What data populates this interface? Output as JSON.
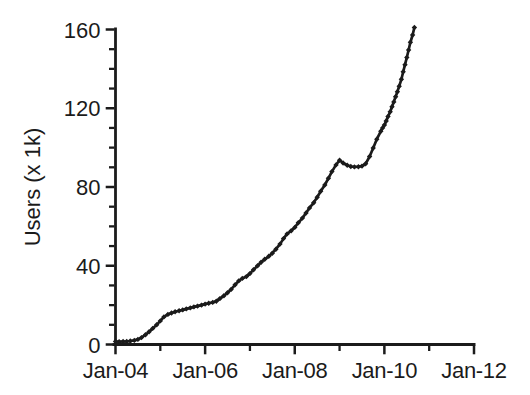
{
  "page": {
    "background": "#ffffff",
    "ink_color": "#1b1b1b"
  },
  "chart_data": {
    "type": "line",
    "title": "",
    "xlabel": "",
    "ylabel": "Users (x 1k)",
    "grid": false,
    "legend": null,
    "x_unit": "years after Jan-2004",
    "xlim": [
      0,
      8
    ],
    "ylim": [
      0,
      160
    ],
    "x_axis": {
      "major_ticks": [
        {
          "pos": 0,
          "label": "Jan-04"
        },
        {
          "pos": 2,
          "label": "Jan-06"
        },
        {
          "pos": 4,
          "label": "Jan-08"
        },
        {
          "pos": 6,
          "label": "Jan-10"
        },
        {
          "pos": 8,
          "label": "Jan-12"
        }
      ],
      "minor_ticks": [
        1,
        3,
        5,
        7
      ]
    },
    "y_axis": {
      "major_ticks": [
        {
          "pos": 0,
          "label": "0"
        },
        {
          "pos": 40,
          "label": "40"
        },
        {
          "pos": 80,
          "label": "80"
        },
        {
          "pos": 120,
          "label": "120"
        },
        {
          "pos": 160,
          "label": "160"
        }
      ],
      "minor_ticks": [
        10,
        20,
        30,
        50,
        60,
        70,
        90,
        100,
        110,
        130,
        140,
        150
      ]
    },
    "series": [
      {
        "name": "Users",
        "color": "#1b1b1b",
        "marker": "diamond",
        "points": [
          [
            0,
            1.5
          ],
          [
            0.08,
            1.4
          ],
          [
            0.17,
            1.5
          ],
          [
            0.25,
            1.6
          ],
          [
            0.33,
            1.8
          ],
          [
            0.42,
            2.1
          ],
          [
            0.5,
            2.6
          ],
          [
            0.58,
            3.5
          ],
          [
            0.67,
            5
          ],
          [
            0.75,
            6.5
          ],
          [
            0.83,
            8.2
          ],
          [
            0.92,
            10
          ],
          [
            1,
            12
          ],
          [
            1.08,
            14
          ],
          [
            1.17,
            15.3
          ],
          [
            1.25,
            16
          ],
          [
            1.33,
            16.6
          ],
          [
            1.42,
            17.1
          ],
          [
            1.5,
            17.6
          ],
          [
            1.58,
            18.1
          ],
          [
            1.67,
            18.6
          ],
          [
            1.75,
            19.1
          ],
          [
            1.83,
            19.5
          ],
          [
            1.92,
            20
          ],
          [
            2,
            20.5
          ],
          [
            2.08,
            21
          ],
          [
            2.17,
            21.4
          ],
          [
            2.25,
            22
          ],
          [
            2.33,
            23.3
          ],
          [
            2.42,
            24.8
          ],
          [
            2.5,
            26.3
          ],
          [
            2.58,
            28
          ],
          [
            2.67,
            30.3
          ],
          [
            2.75,
            32.3
          ],
          [
            2.83,
            33.6
          ],
          [
            2.92,
            34.5
          ],
          [
            3,
            36
          ],
          [
            3.08,
            38
          ],
          [
            3.17,
            40
          ],
          [
            3.25,
            41.8
          ],
          [
            3.33,
            43.3
          ],
          [
            3.42,
            44.8
          ],
          [
            3.5,
            46.4
          ],
          [
            3.58,
            48.4
          ],
          [
            3.67,
            51
          ],
          [
            3.75,
            53.8
          ],
          [
            3.83,
            56.2
          ],
          [
            3.92,
            57.8
          ],
          [
            4,
            59.5
          ],
          [
            4.08,
            61.8
          ],
          [
            4.17,
            64.2
          ],
          [
            4.25,
            66.8
          ],
          [
            4.33,
            69.4
          ],
          [
            4.42,
            72
          ],
          [
            4.5,
            74.8
          ],
          [
            4.58,
            77.8
          ],
          [
            4.67,
            81
          ],
          [
            4.75,
            84.4
          ],
          [
            4.83,
            87.8
          ],
          [
            4.92,
            91.2
          ],
          [
            5,
            93.6
          ],
          [
            5.08,
            92.2
          ],
          [
            5.17,
            91
          ],
          [
            5.25,
            90.4
          ],
          [
            5.33,
            90.2
          ],
          [
            5.42,
            90.3
          ],
          [
            5.5,
            90.6
          ],
          [
            5.58,
            91.8
          ],
          [
            5.67,
            95.5
          ],
          [
            5.75,
            99.8
          ],
          [
            5.83,
            104.3
          ],
          [
            5.92,
            108.3
          ],
          [
            5.96,
            110
          ],
          [
            6,
            111.5
          ],
          [
            6.04,
            113.5
          ],
          [
            6.08,
            115.8
          ],
          [
            6.13,
            118.2
          ],
          [
            6.17,
            120.8
          ],
          [
            6.21,
            123.2
          ],
          [
            6.25,
            125.8
          ],
          [
            6.29,
            128.4
          ],
          [
            6.33,
            131.2
          ],
          [
            6.38,
            134.7
          ],
          [
            6.42,
            138.5
          ],
          [
            6.46,
            142.1
          ],
          [
            6.5,
            145.8
          ],
          [
            6.54,
            149.6
          ],
          [
            6.58,
            153.5
          ],
          [
            6.63,
            157.2
          ],
          [
            6.67,
            161
          ]
        ]
      }
    ]
  }
}
